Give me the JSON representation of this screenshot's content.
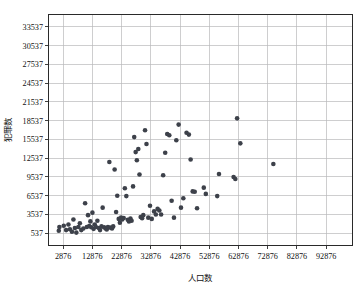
{
  "chart_data": {
    "type": "scatter",
    "title": "",
    "xlabel": "人口数",
    "ylabel": "犯罪数",
    "xlim": [
      -2124,
      101876
    ],
    "ylim": [
      -1463,
      35537
    ],
    "xticks": [
      2876,
      12876,
      22876,
      32876,
      42876,
      52876,
      62876,
      72876,
      82876,
      92876
    ],
    "yticks": [
      537,
      3537,
      6537,
      9537,
      12537,
      15537,
      18537,
      21537,
      24537,
      27537,
      30537,
      33537
    ],
    "xtick_labels": [
      "2876",
      "12876",
      "22876",
      "32876",
      "42876",
      "52876",
      "62876",
      "72876",
      "82876",
      "92876"
    ],
    "ytick_labels": [
      "537",
      "3537",
      "6537",
      "9537",
      "12537",
      "15537",
      "18537",
      "21537",
      "24537",
      "27537",
      "30537",
      "33537"
    ],
    "grid": true,
    "legend": null,
    "marker": {
      "shape": "circle",
      "color": "#3d414a",
      "size": 4.6
    },
    "point_count": 95,
    "points": [
      [
        1400,
        900
      ],
      [
        1600,
        1500
      ],
      [
        3100,
        1700
      ],
      [
        3900,
        1000
      ],
      [
        4700,
        1900
      ],
      [
        5200,
        1150
      ],
      [
        5900,
        750
      ],
      [
        6400,
        2700
      ],
      [
        6900,
        1350
      ],
      [
        7400,
        600
      ],
      [
        8100,
        1500
      ],
      [
        8600,
        2100
      ],
      [
        9100,
        1000
      ],
      [
        9800,
        1250
      ],
      [
        10400,
        5300
      ],
      [
        11000,
        1500
      ],
      [
        11400,
        3400
      ],
      [
        11800,
        1650
      ],
      [
        12200,
        2400
      ],
      [
        12500,
        1450
      ],
      [
        12900,
        3800
      ],
      [
        13300,
        1200
      ],
      [
        13700,
        1900
      ],
      [
        14100,
        1500
      ],
      [
        14600,
        2500
      ],
      [
        15100,
        1350
      ],
      [
        15500,
        1000
      ],
      [
        16000,
        1600
      ],
      [
        16400,
        4600
      ],
      [
        16900,
        1450
      ],
      [
        17400,
        1250
      ],
      [
        17800,
        1100
      ],
      [
        18200,
        1500
      ],
      [
        18700,
        11900
      ],
      [
        19100,
        1400
      ],
      [
        19600,
        1250
      ],
      [
        20000,
        1600
      ],
      [
        20500,
        10700
      ],
      [
        21000,
        3900
      ],
      [
        21400,
        6500
      ],
      [
        21900,
        2800
      ],
      [
        22300,
        2200
      ],
      [
        22700,
        3000
      ],
      [
        23100,
        2700
      ],
      [
        23600,
        2950
      ],
      [
        24000,
        7700
      ],
      [
        24500,
        6450
      ],
      [
        25000,
        2650
      ],
      [
        25400,
        2400
      ],
      [
        25900,
        2850
      ],
      [
        26300,
        2500
      ],
      [
        26800,
        8000
      ],
      [
        27200,
        15900
      ],
      [
        27700,
        13500
      ],
      [
        28100,
        12200
      ],
      [
        28600,
        14000
      ],
      [
        29000,
        9900
      ],
      [
        29400,
        3100
      ],
      [
        29900,
        2900
      ],
      [
        30300,
        3400
      ],
      [
        30900,
        17000
      ],
      [
        31400,
        14800
      ],
      [
        32000,
        3000
      ],
      [
        32600,
        4900
      ],
      [
        33200,
        2800
      ],
      [
        34000,
        4000
      ],
      [
        34600,
        3500
      ],
      [
        35200,
        4400
      ],
      [
        35800,
        4150
      ],
      [
        36400,
        3500
      ],
      [
        37100,
        9800
      ],
      [
        37800,
        13400
      ],
      [
        38500,
        16400
      ],
      [
        39200,
        16200
      ],
      [
        40000,
        5700
      ],
      [
        40800,
        3000
      ],
      [
        41600,
        15400
      ],
      [
        42400,
        17900
      ],
      [
        43200,
        4600
      ],
      [
        44000,
        6100
      ],
      [
        45100,
        16600
      ],
      [
        45900,
        16300
      ],
      [
        46500,
        12300
      ],
      [
        47200,
        7200
      ],
      [
        47900,
        7150
      ],
      [
        48700,
        4500
      ],
      [
        51000,
        7800
      ],
      [
        51700,
        6800
      ],
      [
        55600,
        6450
      ],
      [
        56200,
        10000
      ],
      [
        61200,
        9500
      ],
      [
        61800,
        9200
      ],
      [
        62400,
        18900
      ],
      [
        63500,
        14900
      ],
      [
        74800,
        11600
      ]
    ]
  },
  "axes": {
    "x_title": "人口数",
    "y_title": "犯罪数"
  }
}
